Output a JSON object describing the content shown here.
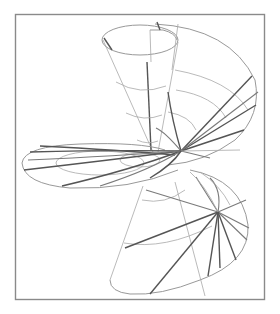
{
  "figure": {
    "colors": {
      "background": "#ffffff",
      "frame": "#8a8a8a",
      "thin_lines": "#a8a8a8",
      "dark_rulings": "#555555"
    },
    "frame": {
      "x": 15,
      "y": 14,
      "width": 249,
      "height": 285
    },
    "parts": [
      {
        "name": "upper-cone",
        "label": ""
      },
      {
        "name": "middle-ellipse-sheet",
        "label": ""
      },
      {
        "name": "right-sweep-sheet",
        "label": ""
      },
      {
        "name": "lower-cone",
        "label": ""
      }
    ]
  }
}
